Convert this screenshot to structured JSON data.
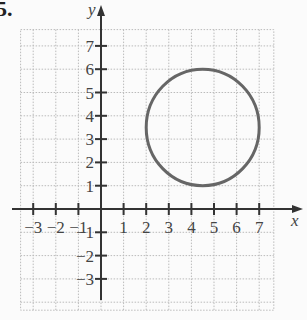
{
  "problem_number": "5.",
  "chart_data": {
    "type": "scatter",
    "title": "",
    "xlabel": "x",
    "ylabel": "y",
    "xlim": [
      -4,
      8
    ],
    "ylim": [
      -4,
      8
    ],
    "grid": true,
    "x_ticks": [
      -3,
      -2,
      -1,
      1,
      2,
      3,
      4,
      5,
      6,
      7
    ],
    "y_ticks": [
      -3,
      -2,
      -1,
      1,
      2,
      3,
      4,
      5,
      6,
      7
    ],
    "x_tick_labels": [
      "−3",
      "−2",
      "−1",
      "1",
      "2",
      "3",
      "4",
      "5",
      "6",
      "7"
    ],
    "y_tick_labels": [
      "−3",
      "−2",
      "−1",
      "1",
      "2",
      "3",
      "4",
      "5",
      "6",
      "7"
    ],
    "shapes": [
      {
        "shape": "circle",
        "center": [
          4.5,
          3.5
        ],
        "radius": 2.5,
        "color": "#666666"
      }
    ]
  },
  "colors": {
    "axis": "#333333",
    "grid": "#bbbbbb",
    "circle": "#666666",
    "text": "#444444"
  }
}
